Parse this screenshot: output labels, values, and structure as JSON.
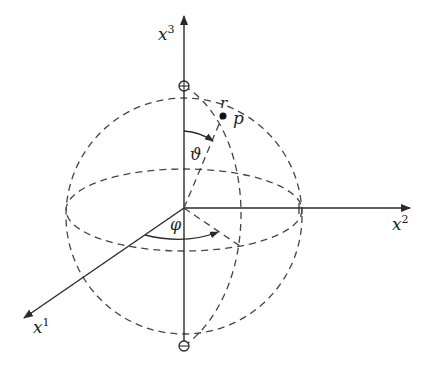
{
  "diagram": {
    "colors": {
      "stroke": "#2a2a2a",
      "dash": "#444444",
      "background": "#ffffff"
    },
    "axes": [
      {
        "id": "x1",
        "base": "x",
        "superscript": "1"
      },
      {
        "id": "x2",
        "base": "x",
        "superscript": "2"
      },
      {
        "id": "x3",
        "base": "x",
        "superscript": "3"
      }
    ],
    "labels": {
      "radius": "r",
      "point": "p",
      "polar_angle": "ϑ",
      "azimuth_angle": "φ"
    },
    "poles": [
      "north-pole",
      "south-pole"
    ]
  }
}
